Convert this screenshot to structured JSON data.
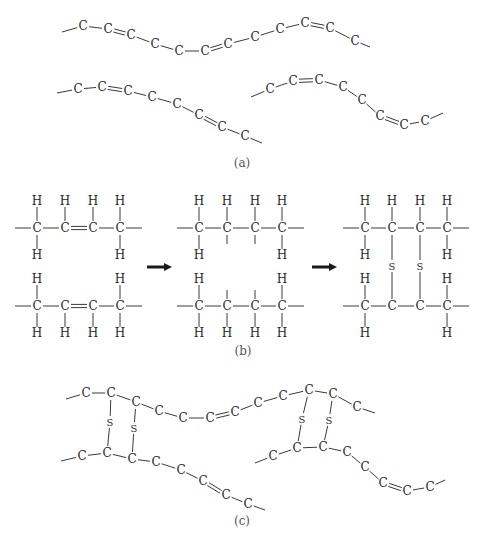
{
  "figure": {
    "panels": [
      {
        "id": "a",
        "label": "(a)",
        "description": "Unsaturated hydrocarbon chains with C=C double bonds"
      },
      {
        "id": "b",
        "label": "(b)",
        "description": "Two chains with C=C double bonds opened and cross-linked via sulfur bridges"
      },
      {
        "id": "c",
        "label": "(c)",
        "description": "Chains cross-linked by S-S bridges"
      }
    ],
    "atoms": {
      "carbon": "C",
      "hydrogen": "H",
      "sulfur": "S"
    },
    "panel_a": {
      "chains": [
        {
          "start": [
            62,
            32
          ],
          "end": [
            370,
            47
          ],
          "carbons": [
            [
              83,
              26
            ],
            [
              108,
              29
            ],
            [
              131,
              35
            ],
            [
              155,
              44
            ],
            [
              179,
              51
            ],
            [
              205,
              51
            ],
            [
              228,
              44
            ],
            [
              255,
              37
            ],
            [
              280,
              29
            ],
            [
              305,
              23
            ],
            [
              330,
              28
            ],
            [
              355,
              41
            ]
          ],
          "double_bonds": [
            [
              1,
              2
            ],
            [
              5,
              6
            ],
            [
              9,
              10
            ]
          ]
        },
        {
          "start": [
            57,
            93
          ],
          "end": [
            262,
            143
          ],
          "carbons": [
            [
              78,
              89
            ],
            [
              102,
              87
            ],
            [
              128,
              91
            ],
            [
              152,
              97
            ],
            [
              177,
              104
            ],
            [
              199,
              115
            ],
            [
              222,
              127
            ],
            [
              245,
              136
            ]
          ],
          "double_bonds": [
            [
              1,
              2
            ],
            [
              5,
              6
            ]
          ]
        },
        {
          "start": [
            251,
            97
          ],
          "end": [
            443,
            113
          ],
          "carbons": [
            [
              270,
              89
            ],
            [
              293,
              81
            ],
            [
              319,
              80
            ],
            [
              343,
              87
            ],
            [
              362,
              100
            ],
            [
              380,
              116
            ],
            [
              404,
              125
            ],
            [
              425,
              121
            ]
          ],
          "double_bonds": [
            [
              1,
              2
            ],
            [
              5,
              6
            ]
          ]
        }
      ]
    },
    "panel_b": {
      "arrows": [
        [
          147,
          172,
          267
        ],
        [
          312,
          337,
          267
        ]
      ],
      "molecules": [
        {
          "x": [
            37,
            65,
            93,
            120
          ],
          "stage": "before",
          "double_bond_between": [
            1,
            2
          ],
          "rows": [
            {
              "c_y": 228,
              "h_top": [
                true,
                true,
                true,
                true
              ],
              "h_bottom": [
                true,
                false,
                false,
                true
              ],
              "stubs_bottom": [
                false,
                false,
                false,
                false
              ]
            },
            {
              "c_y": 306,
              "h_top": [
                true,
                false,
                false,
                true
              ],
              "h_bottom": [
                true,
                true,
                true,
                true
              ],
              "stubs_top": [
                false,
                false,
                false,
                false
              ]
            }
          ]
        },
        {
          "x": [
            199,
            227,
            255,
            282
          ],
          "stage": "opened",
          "rows": [
            {
              "c_y": 228,
              "h_top": [
                true,
                true,
                true,
                true
              ],
              "h_bottom": [
                true,
                false,
                false,
                true
              ],
              "stubs_bottom": [
                false,
                true,
                true,
                false
              ]
            },
            {
              "c_y": 306,
              "h_top": [
                true,
                false,
                false,
                true
              ],
              "h_bottom": [
                true,
                true,
                true,
                true
              ],
              "stubs_top": [
                false,
                true,
                true,
                false
              ]
            }
          ]
        },
        {
          "x": [
            365,
            392,
            420,
            447
          ],
          "stage": "crosslinked",
          "sulfur_y": 266,
          "rows": [
            {
              "c_y": 228,
              "h_top": [
                true,
                true,
                true,
                true
              ],
              "h_bottom": [
                true,
                false,
                false,
                true
              ]
            },
            {
              "c_y": 306,
              "h_top": [
                true,
                false,
                false,
                true
              ],
              "h_bottom": [
                true,
                false,
                false,
                true
              ]
            }
          ]
        }
      ]
    },
    "panel_c": {
      "chains": [
        {
          "start": [
            66,
            399
          ],
          "end": [
            375,
            413
          ],
          "carbons": [
            [
              86,
              393
            ],
            [
              111,
              393
            ],
            [
              136,
              402
            ],
            [
              159,
              411
            ],
            [
              183,
              418
            ],
            [
              210,
              418
            ],
            [
              235,
              412
            ],
            [
              258,
              403
            ],
            [
              283,
              396
            ],
            [
              309,
              390
            ],
            [
              333,
              394
            ],
            [
              357,
              407
            ]
          ],
          "double_bonds": [
            [
              5,
              6
            ]
          ]
        },
        {
          "start": [
            61,
            461
          ],
          "end": [
            265,
            510
          ],
          "carbons": [
            [
              82,
              456
            ],
            [
              107,
              453
            ],
            [
              132,
              459
            ],
            [
              156,
              462
            ],
            [
              181,
              470
            ],
            [
              203,
              481
            ],
            [
              226,
              495
            ],
            [
              248,
              504
            ]
          ],
          "double_bonds": [
            [
              5,
              6
            ]
          ]
        },
        {
          "start": [
            255,
            463
          ],
          "end": [
            445,
            480
          ],
          "carbons": [
            [
              273,
              456
            ],
            [
              297,
              448
            ],
            [
              323,
              447
            ],
            [
              347,
              452
            ],
            [
              365,
              467
            ],
            [
              383,
              483
            ],
            [
              407,
              491
            ],
            [
              430,
              487
            ]
          ],
          "double_bonds": [
            [
              5,
              6
            ]
          ]
        }
      ],
      "bridges": [
        {
          "top": [
            111,
            393
          ],
          "s": [
            110,
            422
          ],
          "bottom": [
            107,
            453
          ]
        },
        {
          "top": [
            136,
            402
          ],
          "s": [
            134,
            428
          ],
          "bottom": [
            132,
            459
          ]
        },
        {
          "top": [
            309,
            390
          ],
          "s": [
            302,
            419
          ],
          "bottom": [
            297,
            448
          ]
        },
        {
          "top": [
            333,
            394
          ],
          "s": [
            329,
            420
          ],
          "bottom": [
            323,
            447
          ]
        }
      ]
    },
    "label_positions": {
      "a": [
        242,
        167
      ],
      "b": [
        243,
        355
      ],
      "c": [
        242,
        525
      ]
    }
  }
}
